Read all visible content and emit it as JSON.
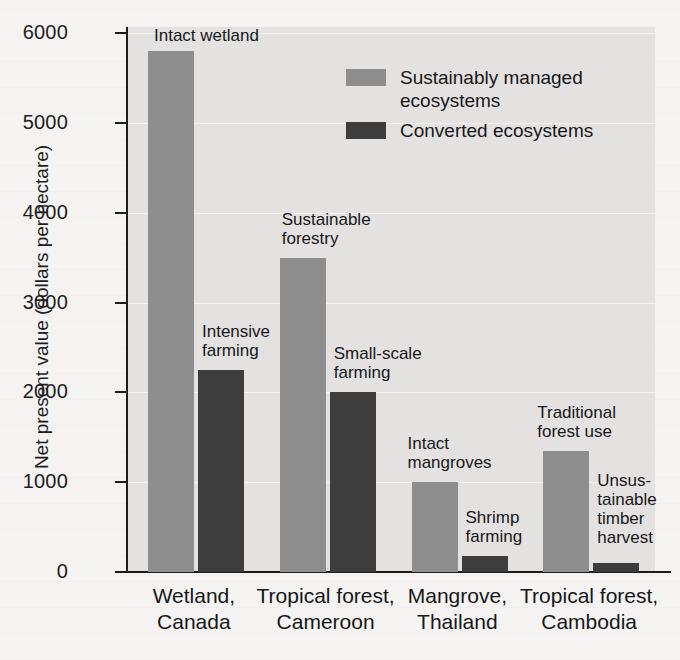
{
  "chart_data": {
    "type": "bar",
    "title": "",
    "xlabel": "",
    "ylabel": "Net present value (dollars per hectare)",
    "ylim": [
      0,
      6000
    ],
    "ytick_labels": [
      "6000",
      "5000",
      "4000",
      "3000",
      "2000",
      "1000",
      "0"
    ],
    "ytick_values": [
      6000,
      5000,
      4000,
      3000,
      2000,
      1000,
      0
    ],
    "grid": true,
    "legend_position": "top-right",
    "categories": [
      "Wetland,\nCanada",
      "Tropical forest,\nCameroon",
      "Mangrove,\nThailand",
      "Tropical forest,\nCambodia"
    ],
    "series": [
      {
        "name": "Sustainably managed\necosystems",
        "color": "#8e8e8e",
        "values": [
          5800,
          3500,
          1000,
          1350
        ],
        "point_labels": [
          "Intact wetland",
          "Sustainable\nforestry",
          "Intact\nmangroves",
          "Traditional\nforest use"
        ]
      },
      {
        "name": "Converted ecosystems",
        "color": "#3d3d3d",
        "values": [
          2250,
          2000,
          175,
          100
        ],
        "point_labels": [
          "Intensive\nfarming",
          "Small-scale\nfarming",
          "Shrimp\nfarming",
          "Unsus-\ntainable\ntimber\nharvest"
        ]
      }
    ]
  },
  "legend": {
    "items": [
      {
        "label": "Sustainably managed\necosystems",
        "color": "#8e8e8e"
      },
      {
        "label": "Converted ecosystems",
        "color": "#3d3d3d"
      }
    ]
  },
  "colors": {
    "plot_background": "#e3e2e0",
    "page_background": "#f4f3f1",
    "axis": "#1d1d1d",
    "gridline": "#f3f2f1",
    "series_light": "#8e8e8e",
    "series_dark": "#3d3d3d"
  }
}
